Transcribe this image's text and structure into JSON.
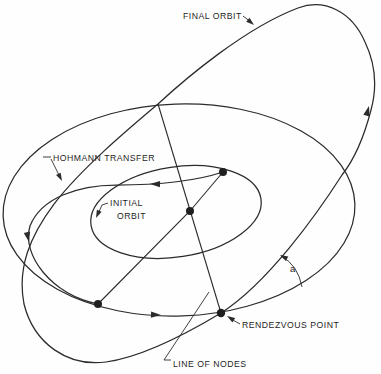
{
  "figure": {
    "type": "orbital-mechanics-diagram",
    "colors": {
      "background": "#fefefe",
      "line": "#2b2b2b",
      "text": "#1f1f1f"
    },
    "labels": {
      "final_orbit": "FINAL ORBIT",
      "hohmann_transfer": "HOHMANN TRANSFER",
      "initial_orbit_line1": "INITIAL",
      "initial_orbit_line2": "ORBIT",
      "rendezvous_point": "RENDEZVOUS POINT",
      "line_of_nodes": "LINE OF NODES",
      "plane_change_angle": "a"
    }
  }
}
